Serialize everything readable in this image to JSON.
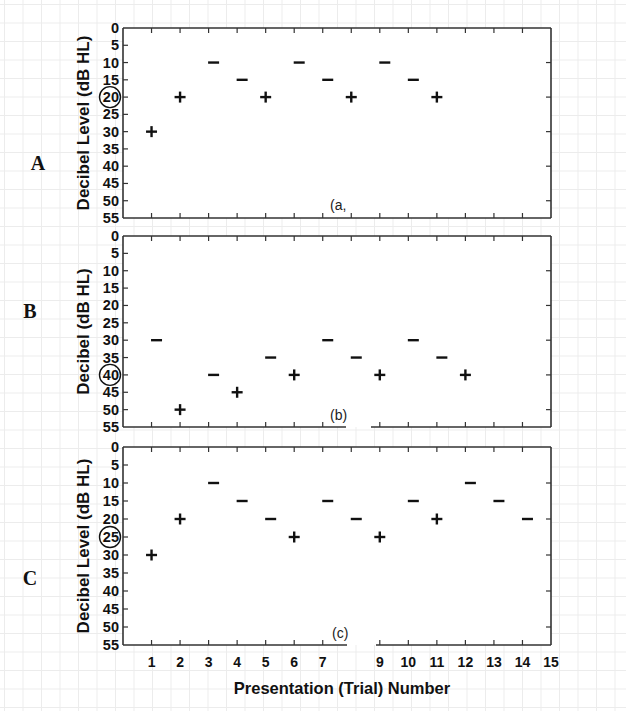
{
  "chart_data": [
    {
      "type": "scatter",
      "panel": "A",
      "sublabel": "(a,",
      "ylabel": "Decibel Level (dB HL)",
      "xlabel": "Presentation (Trial) Number",
      "ylim": [
        0,
        55
      ],
      "y_inverted": true,
      "yticks": [
        0,
        5,
        10,
        15,
        20,
        25,
        30,
        35,
        40,
        45,
        50,
        55
      ],
      "circled_ytick": 20,
      "xlim": [
        0,
        15
      ],
      "series": [
        {
          "name": "+ (heard)",
          "points": [
            [
              1,
              30
            ],
            [
              2,
              20
            ],
            [
              5,
              20
            ],
            [
              8,
              20
            ],
            [
              11,
              20
            ]
          ]
        },
        {
          "name": "- (not heard)",
          "points": [
            [
              3,
              10
            ],
            [
              4,
              15
            ],
            [
              6,
              10
            ],
            [
              7,
              15
            ],
            [
              9,
              10
            ],
            [
              10,
              15
            ]
          ]
        }
      ],
      "sequence": [
        {
          "trial": 1,
          "level": 30,
          "response": "+"
        },
        {
          "trial": 2,
          "level": 20,
          "response": "+"
        },
        {
          "trial": 3,
          "level": 10,
          "response": "-"
        },
        {
          "trial": 4,
          "level": 15,
          "response": "-"
        },
        {
          "trial": 5,
          "level": 20,
          "response": "+"
        },
        {
          "trial": 6,
          "level": 10,
          "response": "-"
        },
        {
          "trial": 7,
          "level": 15,
          "response": "-"
        },
        {
          "trial": 8,
          "level": 20,
          "response": "+"
        },
        {
          "trial": 9,
          "level": 10,
          "response": "-"
        },
        {
          "trial": 10,
          "level": 15,
          "response": "-"
        },
        {
          "trial": 11,
          "level": 20,
          "response": "+"
        }
      ],
      "grid": false
    },
    {
      "type": "scatter",
      "panel": "B",
      "sublabel": "(b)",
      "ylabel": "Decibel (dB HL)",
      "xlabel": "Presentation (Trial) Number",
      "ylim": [
        0,
        55
      ],
      "y_inverted": true,
      "yticks": [
        0,
        5,
        10,
        15,
        20,
        25,
        30,
        35,
        40,
        45,
        50,
        55
      ],
      "circled_ytick": 40,
      "xlim": [
        0,
        15
      ],
      "axis_gap": true,
      "series": [
        {
          "name": "+ (heard)",
          "points": [
            [
              2,
              50
            ],
            [
              4,
              45
            ],
            [
              6,
              40
            ],
            [
              9,
              40
            ],
            [
              12,
              40
            ]
          ]
        },
        {
          "name": "- (not heard)",
          "points": [
            [
              1,
              30
            ],
            [
              3,
              40
            ],
            [
              5,
              35
            ],
            [
              7,
              30
            ],
            [
              8,
              35
            ],
            [
              10,
              30
            ],
            [
              11,
              35
            ]
          ]
        }
      ],
      "sequence": [
        {
          "trial": 1,
          "level": 30,
          "response": "-"
        },
        {
          "trial": 2,
          "level": 50,
          "response": "+"
        },
        {
          "trial": 3,
          "level": 40,
          "response": "-"
        },
        {
          "trial": 4,
          "level": 45,
          "response": "+"
        },
        {
          "trial": 5,
          "level": 35,
          "response": "-"
        },
        {
          "trial": 6,
          "level": 40,
          "response": "+"
        },
        {
          "trial": 7,
          "level": 30,
          "response": "-"
        },
        {
          "trial": 8,
          "level": 35,
          "response": "-"
        },
        {
          "trial": 9,
          "level": 40,
          "response": "+"
        },
        {
          "trial": 10,
          "level": 30,
          "response": "-"
        },
        {
          "trial": 11,
          "level": 35,
          "response": "-"
        },
        {
          "trial": 12,
          "level": 40,
          "response": "+"
        }
      ],
      "grid": false
    },
    {
      "type": "scatter",
      "panel": "C",
      "sublabel": "(c)",
      "ylabel": "Decibel Level (dB HL)",
      "xlabel": "Presentation (Trial) Number",
      "ylim": [
        0,
        55
      ],
      "y_inverted": true,
      "yticks": [
        0,
        5,
        10,
        15,
        20,
        25,
        30,
        35,
        40,
        45,
        50,
        55
      ],
      "circled_ytick": 25,
      "xlim": [
        0,
        15
      ],
      "xticks": [
        1,
        2,
        3,
        4,
        5,
        6,
        7,
        9,
        10,
        11,
        12,
        13,
        14,
        15
      ],
      "axis_gap": true,
      "series": [
        {
          "name": "+ (heard)",
          "points": [
            [
              1,
              30
            ],
            [
              2,
              20
            ],
            [
              6,
              25
            ],
            [
              9,
              25
            ],
            [
              11,
              20
            ]
          ]
        },
        {
          "name": "- (not heard)",
          "points": [
            [
              3,
              10
            ],
            [
              4,
              15
            ],
            [
              5,
              20
            ],
            [
              7,
              15
            ],
            [
              8,
              20
            ],
            [
              10,
              15
            ],
            [
              12,
              10
            ],
            [
              13,
              15
            ],
            [
              14,
              20
            ]
          ]
        }
      ],
      "sequence": [
        {
          "trial": 1,
          "level": 30,
          "response": "+"
        },
        {
          "trial": 2,
          "level": 20,
          "response": "+"
        },
        {
          "trial": 3,
          "level": 10,
          "response": "-"
        },
        {
          "trial": 4,
          "level": 15,
          "response": "-"
        },
        {
          "trial": 5,
          "level": 20,
          "response": "-"
        },
        {
          "trial": 6,
          "level": 25,
          "response": "+"
        },
        {
          "trial": 7,
          "level": 15,
          "response": "-"
        },
        {
          "trial": 8,
          "level": 20,
          "response": "-"
        },
        {
          "trial": 9,
          "level": 25,
          "response": "+"
        },
        {
          "trial": 10,
          "level": 15,
          "response": "-"
        },
        {
          "trial": 11,
          "level": 20,
          "response": "+"
        },
        {
          "trial": 12,
          "level": 10,
          "response": "-"
        },
        {
          "trial": 13,
          "level": 15,
          "response": "-"
        },
        {
          "trial": 14,
          "level": 20,
          "response": "-"
        }
      ],
      "grid": false
    }
  ],
  "figure": {
    "panel_letters": [
      "A",
      "B",
      "C"
    ],
    "xlabel": "Presentation (Trial) Number",
    "xtick_labels": [
      "1",
      "2",
      "3",
      "4",
      "5",
      "6",
      "7",
      "9",
      "10",
      "11",
      "12",
      "13",
      "14",
      "15"
    ]
  },
  "layout": {
    "frame_left": 123,
    "frame_right": 551,
    "panels": [
      {
        "top": 28,
        "bottom": 218,
        "letter_x": 38,
        "letter_y": 170,
        "label_x": 89,
        "sub_x": 330,
        "sub_y": 210,
        "gap": null
      },
      {
        "top": 236,
        "bottom": 427,
        "letter_x": 30,
        "letter_y": 318,
        "label_x": 89,
        "sub_x": 330,
        "sub_y": 420,
        "gap": [
          346,
          371
        ]
      },
      {
        "top": 447,
        "bottom": 645,
        "letter_x": 30,
        "letter_y": 585,
        "label_x": 89,
        "sub_x": 332,
        "sub_y": 638,
        "gap": [
          347,
          376
        ]
      }
    ],
    "xtick_label_y": 667,
    "xlabel_y": 694,
    "minus_offset": 5
  }
}
